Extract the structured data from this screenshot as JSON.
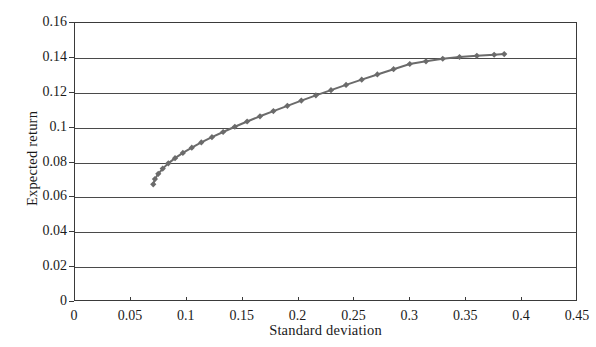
{
  "chart_data": {
    "type": "line",
    "title": "",
    "xlabel": "Standard deviation",
    "ylabel": "Expected return",
    "xlim": [
      0,
      0.45
    ],
    "ylim": [
      0,
      0.16
    ],
    "xticks": [
      "0",
      "0.05",
      "0.1",
      "0.15",
      "0.2",
      "0.25",
      "0.3",
      "0.35",
      "0.4",
      "0.45"
    ],
    "xtick_values": [
      0,
      0.05,
      0.1,
      0.15,
      0.2,
      0.25,
      0.3,
      0.35,
      0.4,
      0.45
    ],
    "yticks": [
      "0",
      "0.02",
      "0.04",
      "0.06",
      "0.08",
      "0.1",
      "0.12",
      "0.14",
      "0.16"
    ],
    "ytick_values": [
      0,
      0.02,
      0.04,
      0.06,
      0.08,
      0.1,
      0.12,
      0.14,
      0.16
    ],
    "grid": "horizontal",
    "legend": "none",
    "series": [
      {
        "name": "Efficient frontier",
        "marker": "diamond",
        "color": "#6b6b6b",
        "line_color": "#6b6b6b",
        "x": [
          0.07,
          0.0715,
          0.0745,
          0.0785,
          0.0835,
          0.0895,
          0.0965,
          0.1045,
          0.113,
          0.1225,
          0.1325,
          0.143,
          0.154,
          0.1655,
          0.1775,
          0.19,
          0.2025,
          0.2155,
          0.229,
          0.2425,
          0.2565,
          0.2705,
          0.285,
          0.2995,
          0.314,
          0.329,
          0.344,
          0.3595,
          0.375,
          0.384
        ],
        "y": [
          0.0675,
          0.0705,
          0.0735,
          0.0765,
          0.0795,
          0.0825,
          0.0855,
          0.0885,
          0.0915,
          0.0945,
          0.0975,
          0.1005,
          0.1035,
          0.1065,
          0.1095,
          0.1125,
          0.1155,
          0.1185,
          0.1215,
          0.1245,
          0.1275,
          0.1305,
          0.1335,
          0.1365,
          0.138,
          0.1395,
          0.1405,
          0.1412,
          0.1418,
          0.1422
        ]
      }
    ]
  },
  "axes": {
    "y_title": "Expected return",
    "x_title": "Standard deviation"
  }
}
